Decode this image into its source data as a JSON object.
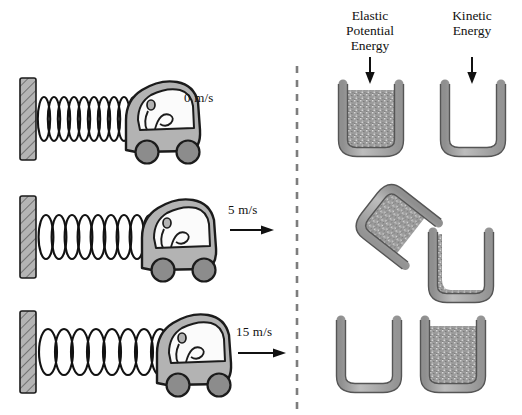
{
  "figure": {
    "title_present": false,
    "left_panel": {
      "name": "spring-car-sequence",
      "rows": [
        {
          "id": "row-top",
          "speed_label": "0 m/s",
          "speed_value": 0,
          "units": "m/s",
          "arrow": false,
          "spring_state": "fully compressed",
          "coils": 11,
          "car_position": "against compressed spring"
        },
        {
          "id": "row-middle",
          "speed_label": "5 m/s",
          "speed_value": 5,
          "units": "m/s",
          "arrow": true,
          "spring_state": "partially extended",
          "coils": 10,
          "car_position": "moving right"
        },
        {
          "id": "row-bottom",
          "speed_label": "15 m/s",
          "speed_value": 15,
          "units": "m/s",
          "arrow": true,
          "spring_state": "relaxed / fully extended",
          "coils": 9,
          "car_position": "leaving spring"
        }
      ]
    },
    "divider": {
      "style": "dashed-vertical"
    },
    "right_panel": {
      "name": "energy-bucket-columns",
      "columns": [
        {
          "id": "col-elastic",
          "label": "Elastic\nPotential\nEnergy",
          "label_lines": [
            "Elastic",
            "Potential",
            "Energy"
          ],
          "arrow": "down"
        },
        {
          "id": "col-kinetic",
          "label": "Kinetic\nEnergy",
          "label_lines": [
            "Kinetic",
            "Energy"
          ],
          "arrow": "down"
        }
      ],
      "rows": [
        {
          "id": "buckets-top",
          "elastic_fill": 1.0,
          "kinetic_fill": 0.0,
          "elastic_state": "full",
          "kinetic_state": "empty",
          "pouring": false
        },
        {
          "id": "buckets-middle",
          "elastic_fill": 0.6,
          "kinetic_fill": 0.4,
          "elastic_state": "pouring",
          "kinetic_state": "filling",
          "pouring": true
        },
        {
          "id": "buckets-bottom",
          "elastic_fill": 0.0,
          "kinetic_fill": 1.0,
          "elastic_state": "empty",
          "kinetic_state": "full",
          "pouring": false
        }
      ]
    },
    "colors": {
      "outline": "#1b1b1b",
      "car_body": "#b3b3b3",
      "wheel": "#8c8c8c",
      "wall": "#b0b0b0",
      "bucket_wall": "#a9a9a9",
      "fill_speckle": "#9a9a9a",
      "divider": "#7d7d7d",
      "text": "#111111"
    }
  }
}
